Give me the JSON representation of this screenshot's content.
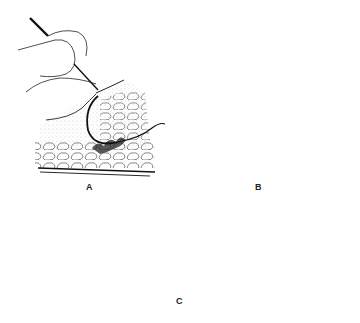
{
  "figure": {
    "panels": [
      {
        "id": "A",
        "label": "A",
        "description": "Left hand holding needle holder, curved suture passing through stippled tissue layer over fat lobules"
      },
      {
        "id": "B",
        "label": "B",
        "description": "Mirror view: right hand with needle holder, suture looped through tissue on opposite side"
      },
      {
        "id": "C",
        "label": "C",
        "description": "Completed closure: circular suture loop tied beneath skin surface, tissue approximated at midline"
      }
    ],
    "colors": {
      "ink": "#1a1a1a",
      "stipple": "#9a9a9a",
      "background": "#ffffff"
    }
  }
}
